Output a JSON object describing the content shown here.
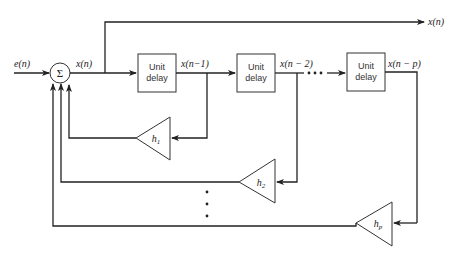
{
  "diagram": {
    "type": "block-diagram",
    "input_label": "e(n)",
    "summer_symbol": "Σ",
    "summer_output_label": "x(n)",
    "output_label": "x(n)",
    "delay_blocks": [
      {
        "line1": "Unit",
        "line2": "delay",
        "output_label": "x(n−1)"
      },
      {
        "line1": "Unit",
        "line2": "delay",
        "output_label": "x(n − 2)"
      },
      {
        "line1": "Unit",
        "line2": "delay",
        "output_label": "x(n − p)"
      }
    ],
    "gains": [
      {
        "label": "h",
        "subscript": "1"
      },
      {
        "label": "h",
        "subscript": "2"
      },
      {
        "label": "h",
        "subscript": "p"
      }
    ],
    "ellipsis_horizontal": "• • •",
    "ellipsis_vertical": "⋮"
  }
}
